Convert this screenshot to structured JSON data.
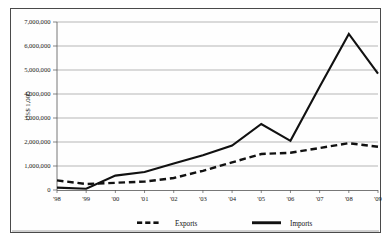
{
  "chart_data": {
    "type": "line",
    "title": "",
    "subtitle": "",
    "xlabel": "",
    "ylabel": "US$ 1,000",
    "categories": [
      "'98",
      "'99",
      "'00",
      "'01",
      "'02",
      "'03",
      "'04",
      "'05",
      "'06",
      "'07",
      "'08",
      "'09"
    ],
    "ylim": [
      0,
      7000000
    ],
    "ytick_values": [
      0,
      1000000,
      2000000,
      3000000,
      4000000,
      5000000,
      6000000,
      7000000
    ],
    "ytick_labels": [
      "0",
      "1,000,000",
      "2,000,000",
      "3,000,000",
      "4,000,000",
      "5,000,000",
      "6,000,000",
      "7,000,000"
    ],
    "grid": true,
    "grid_axis": "y",
    "legend_position": "bottom",
    "series": [
      {
        "name": "Exports",
        "style": "dashed",
        "color": "#111111",
        "values": [
          400000,
          250000,
          300000,
          350000,
          500000,
          800000,
          1150000,
          1500000,
          1550000,
          1750000,
          1950000,
          1800000
        ]
      },
      {
        "name": "Imports",
        "style": "solid",
        "color": "#111111",
        "values": [
          100000,
          50000,
          600000,
          750000,
          1100000,
          1450000,
          1850000,
          2750000,
          2050000,
          4300000,
          6500000,
          4850000
        ]
      }
    ]
  },
  "legend": {
    "items": [
      {
        "label": "Exports",
        "style": "dashed"
      },
      {
        "label": "Imports",
        "style": "solid"
      }
    ]
  },
  "axes": {
    "y_title": "US$ 1,000"
  }
}
